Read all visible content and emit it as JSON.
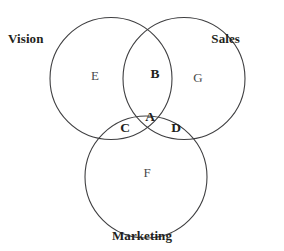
{
  "diagram": {
    "type": "venn-3-set",
    "title_visible": false,
    "background_color": "#ffffff",
    "stroke_color": "#3f3f41",
    "stroke_width": 1.1,
    "canvas": {
      "width": 284,
      "height": 251
    },
    "sets": [
      {
        "key": "vision",
        "label": "Vision",
        "label_position": "top-left",
        "circle": {
          "cx": 111,
          "cy": 78.5,
          "r": 61
        }
      },
      {
        "key": "sales",
        "label": "Sales",
        "label_position": "top-right",
        "circle": {
          "cx": 184,
          "cy": 78.5,
          "r": 61
        }
      },
      {
        "key": "marketing",
        "label": "Marketing",
        "label_position": "bottom-center",
        "circle": {
          "cx": 146,
          "cy": 177,
          "r": 61
        }
      }
    ],
    "regions": [
      {
        "key": "A",
        "label": "A",
        "weight": "bold",
        "sets": [
          "vision",
          "sales",
          "marketing"
        ],
        "x": 150,
        "y": 117
      },
      {
        "key": "B",
        "label": "B",
        "weight": "bold",
        "sets": [
          "vision",
          "sales"
        ],
        "x": 155,
        "y": 74
      },
      {
        "key": "C",
        "label": "C",
        "weight": "bold",
        "sets": [
          "vision",
          "marketing"
        ],
        "x": 125,
        "y": 128
      },
      {
        "key": "D",
        "label": "D",
        "weight": "bold",
        "sets": [
          "sales",
          "marketing"
        ],
        "x": 176,
        "y": 128
      },
      {
        "key": "E",
        "label": "E",
        "weight": "regular",
        "sets": [
          "vision"
        ],
        "x": 95,
        "y": 76
      },
      {
        "key": "F",
        "label": "F",
        "weight": "regular",
        "sets": [
          "marketing"
        ],
        "x": 147,
        "y": 173
      },
      {
        "key": "G",
        "label": "G",
        "weight": "regular",
        "sets": [
          "sales"
        ],
        "x": 198,
        "y": 78
      }
    ]
  }
}
